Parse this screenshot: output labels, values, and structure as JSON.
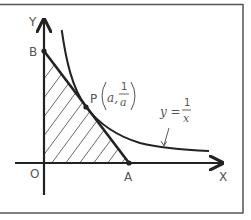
{
  "diagram": {
    "labels": {
      "y_axis": "Y",
      "x_axis": "X",
      "origin": "O",
      "point_a": "A",
      "point_b": "B",
      "point_p": "P",
      "p_coord_x": "a,",
      "p_coord_num": "1",
      "p_coord_den": "a",
      "curve_lhs": "y =",
      "curve_num": "1",
      "curve_den": "x"
    },
    "colors": {
      "line": "#222222",
      "frame": "#555555",
      "text": "#555555",
      "hatch": "#444444"
    },
    "elements": [
      {
        "type": "axis",
        "name": "x-axis"
      },
      {
        "type": "axis",
        "name": "y-axis"
      },
      {
        "type": "curve",
        "equation": "y = 1/x"
      },
      {
        "type": "line",
        "name": "tangent-line",
        "through": [
          "B",
          "P",
          "A"
        ]
      },
      {
        "type": "region",
        "name": "triangle-OAB",
        "fill": "hatched"
      }
    ]
  }
}
